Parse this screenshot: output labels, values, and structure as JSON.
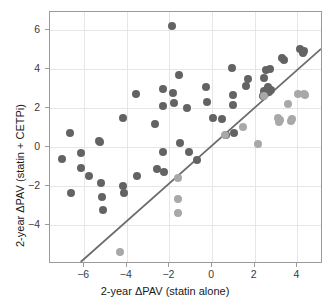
{
  "chart_data": {
    "type": "scatter",
    "title": "",
    "xlabel": "2-year ΔPAV (statin alone)",
    "ylabel": "2-year ΔPAV (statin + CETPi)",
    "xlim": [
      -7.6,
      5.2
    ],
    "ylim": [
      -6.0,
      6.9
    ],
    "xticks": [
      -6,
      -4,
      -2,
      0,
      2,
      4
    ],
    "xticklabels": [
      "−6",
      "−4",
      "−2",
      "0",
      "2",
      "4"
    ],
    "yticks": [
      -4,
      -2,
      0,
      2,
      4,
      6
    ],
    "yticklabels": [
      "−4",
      "−2",
      "0",
      "2",
      "4",
      "6"
    ],
    "grid": true,
    "legend": "none",
    "colors": {
      "dark_points": "#636363",
      "light_points": "#a8a8a8",
      "fit_line": "#6b6b6b",
      "grid": "#e6e6e6",
      "axis": "#9a9a9a"
    },
    "reference_line": {
      "label": "identity-line",
      "x_start": -6.15,
      "y_start": -6.0,
      "x_end": 5.2,
      "y_end": 5.0
    },
    "series": [
      {
        "name": "dark",
        "color": "#636363",
        "points": [
          [
            -7.05,
            -0.65
          ],
          [
            -6.65,
            0.7
          ],
          [
            -6.6,
            -2.35
          ],
          [
            -6.15,
            -0.3
          ],
          [
            -6.15,
            -1.1
          ],
          [
            -5.75,
            -1.5
          ],
          [
            -5.3,
            0.32
          ],
          [
            -5.25,
            0.22
          ],
          [
            -5.2,
            -1.85
          ],
          [
            -5.15,
            -2.55
          ],
          [
            -5.1,
            -3.25
          ],
          [
            -4.2,
            1.45
          ],
          [
            -4.2,
            -2.0
          ],
          [
            -4.15,
            -2.35
          ],
          [
            -3.55,
            2.7
          ],
          [
            -3.5,
            -1.5
          ],
          [
            -2.7,
            1.18
          ],
          [
            -2.6,
            -1.15
          ],
          [
            -2.3,
            2.95
          ],
          [
            -2.3,
            2.1
          ],
          [
            -2.3,
            -0.25
          ],
          [
            -2.25,
            -1.3
          ],
          [
            -1.9,
            6.2
          ],
          [
            -1.85,
            2.75
          ],
          [
            -1.8,
            2.22
          ],
          [
            -1.55,
            3.67
          ],
          [
            -1.5,
            0.18
          ],
          [
            -1.2,
            2.0
          ],
          [
            -1.1,
            -0.25
          ],
          [
            -0.7,
            -0.7
          ],
          [
            -0.3,
            3.08
          ],
          [
            -0.25,
            2.28
          ],
          [
            0.05,
            1.48
          ],
          [
            0.45,
            1.42
          ],
          [
            0.65,
            0.58
          ],
          [
            0.95,
            4.05
          ],
          [
            1.0,
            2.65
          ],
          [
            1.0,
            2.12
          ],
          [
            1.05,
            0.7
          ],
          [
            1.6,
            3.12
          ],
          [
            1.7,
            3.45
          ],
          [
            2.4,
            2.62
          ],
          [
            2.45,
            3.5
          ],
          [
            2.45,
            2.88
          ],
          [
            2.55,
            3.92
          ],
          [
            2.6,
            3.05
          ],
          [
            2.6,
            2.85
          ],
          [
            2.65,
            2.8
          ],
          [
            2.7,
            4.0
          ],
          [
            2.75,
            2.92
          ],
          [
            3.3,
            4.55
          ],
          [
            3.35,
            4.42
          ],
          [
            4.1,
            5.0
          ],
          [
            4.25,
            4.82
          ],
          [
            4.3,
            4.9
          ]
        ]
      },
      {
        "name": "light",
        "color": "#a8a8a8",
        "points": [
          [
            -4.3,
            -5.4
          ],
          [
            -1.6,
            -1.62
          ],
          [
            -1.62,
            -2.68
          ],
          [
            -1.6,
            -3.38
          ],
          [
            0.6,
            0.6
          ],
          [
            1.45,
            1.02
          ],
          [
            2.15,
            0.12
          ],
          [
            2.45,
            2.6
          ],
          [
            3.1,
            1.48
          ],
          [
            3.15,
            1.28
          ],
          [
            3.2,
            1.35
          ],
          [
            3.55,
            2.2
          ],
          [
            3.7,
            1.32
          ],
          [
            3.75,
            1.42
          ],
          [
            4.05,
            2.68
          ],
          [
            4.3,
            2.7
          ],
          [
            4.35,
            2.65
          ]
        ]
      }
    ]
  }
}
